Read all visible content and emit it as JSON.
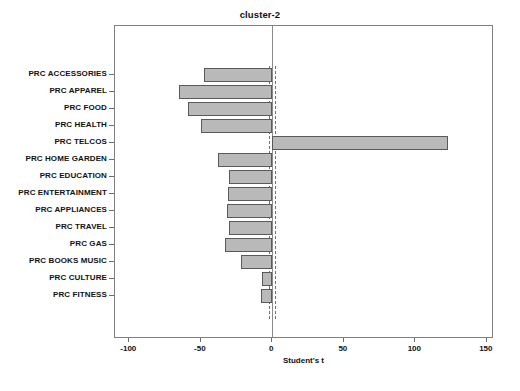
{
  "chart_data": {
    "type": "bar",
    "orientation": "horizontal",
    "title": "cluster-2",
    "xlabel": "Student's t",
    "ylabel": "",
    "xlim": [
      -110,
      155
    ],
    "xticks": [
      -100,
      -50,
      0,
      50,
      100,
      150
    ],
    "xticklabels": [
      "-100",
      "-50",
      "0",
      "50",
      "100",
      "150"
    ],
    "grid": false,
    "legend": null,
    "reference_lines": {
      "zero": 0,
      "critical": [
        -2,
        2
      ],
      "style": "dashed"
    },
    "bar_color": "#b9b9b9",
    "bar_edge_color": "#5a5a5a",
    "categories": [
      "PRC ACCESSORIES",
      "PRC APPAREL",
      "PRC FOOD",
      "PRC HEALTH",
      "PRC TELCOS",
      "PRC HOME GARDEN",
      "PRC EDUCATION",
      "PRC ENTERTAINMENT",
      "PRC APPLIANCES",
      "PRC TRAVEL",
      "PRC GAS",
      "PRC BOOKS MUSIC",
      "PRC CULTURE",
      "PRC FITNESS"
    ],
    "values": [
      -48,
      -65,
      -59,
      -50,
      123,
      -38,
      -30,
      -31,
      -32,
      -30,
      -33,
      -22,
      -7,
      -8
    ]
  }
}
